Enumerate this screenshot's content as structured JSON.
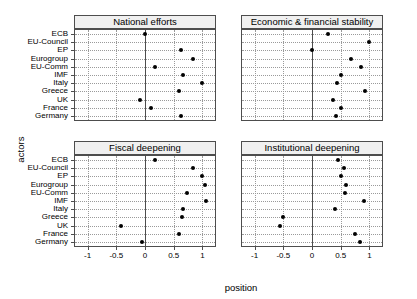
{
  "chart_data": {
    "type": "scatter",
    "title": "",
    "xlabel": "position",
    "ylabel": "actors",
    "xlim": [
      -1.22,
      1.22
    ],
    "xticks": [
      -1,
      -0.5,
      0,
      0.5,
      1
    ],
    "xticklabels": [
      "-1",
      "-0.5",
      "0",
      "0.5",
      "1"
    ],
    "grid": true,
    "legend": "none",
    "categories": [
      "ECB",
      "EU-Council",
      "EP",
      "Eurogroup",
      "EU-Comm",
      "IMF",
      "Italy",
      "Greece",
      "UK",
      "France",
      "Germany"
    ],
    "facets": [
      {
        "label": "National efforts",
        "values": [
          0.0,
          null,
          0.62,
          0.83,
          0.17,
          0.66,
          1.0,
          0.6,
          -0.08,
          0.1,
          0.63
        ]
      },
      {
        "label": "Economic & financial stability",
        "values": [
          0.28,
          1.0,
          0.0,
          0.68,
          0.85,
          0.5,
          0.43,
          0.93,
          0.37,
          0.5,
          0.42
        ]
      },
      {
        "label": "Fiscal deepening",
        "values": [
          0.17,
          0.84,
          1.0,
          1.04,
          0.73,
          1.06,
          0.66,
          0.65,
          -0.42,
          0.6,
          -0.05
        ]
      },
      {
        "label": "Institutional deepening",
        "values": [
          0.45,
          0.55,
          0.5,
          0.6,
          0.58,
          0.9,
          0.4,
          -0.5,
          -0.55,
          0.75,
          0.83
        ]
      }
    ]
  },
  "style": {
    "point_color": "#000000",
    "strip_fill": "#f0f0f0",
    "panel_border": "#4d4d4d",
    "grid_color": "#9a9a9a",
    "background": "#ffffff"
  }
}
